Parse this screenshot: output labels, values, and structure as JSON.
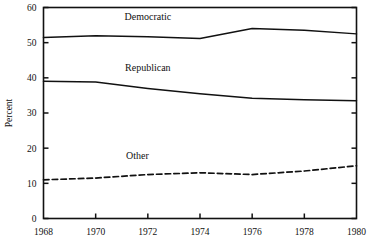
{
  "chart_data": {
    "type": "line",
    "title": "",
    "xlabel": "",
    "ylabel": "Percent",
    "x": [
      1968,
      1970,
      1972,
      1974,
      1976,
      1978,
      1980
    ],
    "xticklabels": [
      "1968",
      "1970",
      "1972",
      "1974",
      "1976",
      "1978",
      "1980"
    ],
    "xlim": [
      1968,
      1980
    ],
    "ylim": [
      0,
      60
    ],
    "yticks": [
      0,
      10,
      20,
      30,
      40,
      50,
      60
    ],
    "yticklabels": [
      "0",
      "10",
      "20",
      "30",
      "40",
      "50",
      "60"
    ],
    "grid": false,
    "legend": "inline-labels",
    "series": [
      {
        "name": "Democratic",
        "style": "solid",
        "color": "#111111",
        "values": [
          51.5,
          52.0,
          51.7,
          51.2,
          54.0,
          53.5,
          52.5
        ],
        "label_x": 1972.0,
        "label_y": 56.5
      },
      {
        "name": "Republican",
        "style": "solid",
        "color": "#111111",
        "values": [
          39.0,
          38.8,
          37.0,
          35.5,
          34.2,
          33.8,
          33.5
        ],
        "label_x": 1972.0,
        "label_y": 42.0
      },
      {
        "name": "Other",
        "style": "dashed",
        "color": "#111111",
        "values": [
          11.0,
          11.5,
          12.5,
          13.0,
          12.5,
          13.5,
          15.0
        ],
        "label_x": 1971.6,
        "label_y": 17.0
      }
    ]
  },
  "ylabel_text": "Percent"
}
